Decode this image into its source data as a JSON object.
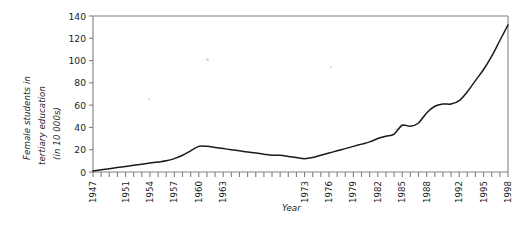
{
  "chart_data": {
    "type": "line",
    "title": "",
    "xlabel": "Year",
    "ylabel": "Female students in tertiary education (in 10 000s)",
    "ylabel_lines": [
      "Female students in",
      "tertiary education",
      "(in 10 000s)"
    ],
    "ylim": [
      0,
      140
    ],
    "yticks": [
      0,
      20,
      40,
      60,
      80,
      100,
      120,
      140
    ],
    "ytick_labels": [
      "0",
      "20",
      "40",
      "60",
      "80",
      "100",
      "120",
      "140"
    ],
    "grid": false,
    "legend": "none",
    "x_axis_tick_count": 52,
    "xtick_labels": [
      {
        "year": 1947,
        "label": "1947"
      },
      {
        "year": 1951,
        "label": "1951"
      },
      {
        "year": 1954,
        "label": "1954"
      },
      {
        "year": 1957,
        "label": "1957"
      },
      {
        "year": 1960,
        "label": "1960"
      },
      {
        "year": 1963,
        "label": "1963"
      },
      {
        "year": 1973,
        "label": "1973"
      },
      {
        "year": 1976,
        "label": "1976"
      },
      {
        "year": 1979,
        "label": "1979"
      },
      {
        "year": 1982,
        "label": "1982"
      },
      {
        "year": 1985,
        "label": "1985"
      },
      {
        "year": 1988,
        "label": "1988"
      },
      {
        "year": 1992,
        "label": "1992"
      },
      {
        "year": 1995,
        "label": "1995"
      },
      {
        "year": 1998,
        "label": "1998"
      }
    ],
    "x": [
      1947,
      1948,
      1949,
      1950,
      1951,
      1952,
      1953,
      1954,
      1955,
      1956,
      1957,
      1958,
      1959,
      1960,
      1961,
      1962,
      1963,
      1964,
      1965,
      1966,
      1967,
      1968,
      1969,
      1970,
      1971,
      1972,
      1973,
      1974,
      1975,
      1976,
      1977,
      1978,
      1979,
      1980,
      1981,
      1982,
      1983,
      1984,
      1985,
      1986,
      1987,
      1988,
      1989,
      1990,
      1991,
      1992,
      1993,
      1994,
      1995,
      1996,
      1997,
      1998
    ],
    "values": [
      1,
      2,
      3,
      4,
      5,
      6,
      7,
      8,
      9,
      10,
      12,
      15,
      19,
      23,
      23,
      22,
      21,
      20,
      19,
      18,
      17,
      16,
      15,
      15,
      14,
      13,
      12,
      13,
      15,
      17,
      19,
      21,
      23,
      25,
      27,
      30,
      32,
      34,
      42,
      41,
      44,
      53,
      59,
      61,
      61,
      64,
      72,
      82,
      92,
      104,
      118,
      132
    ],
    "series_name": "Female students in tertiary education",
    "line_color": "#1a1a1a",
    "axis_color": "#808080",
    "background_color": "#ffffff"
  }
}
